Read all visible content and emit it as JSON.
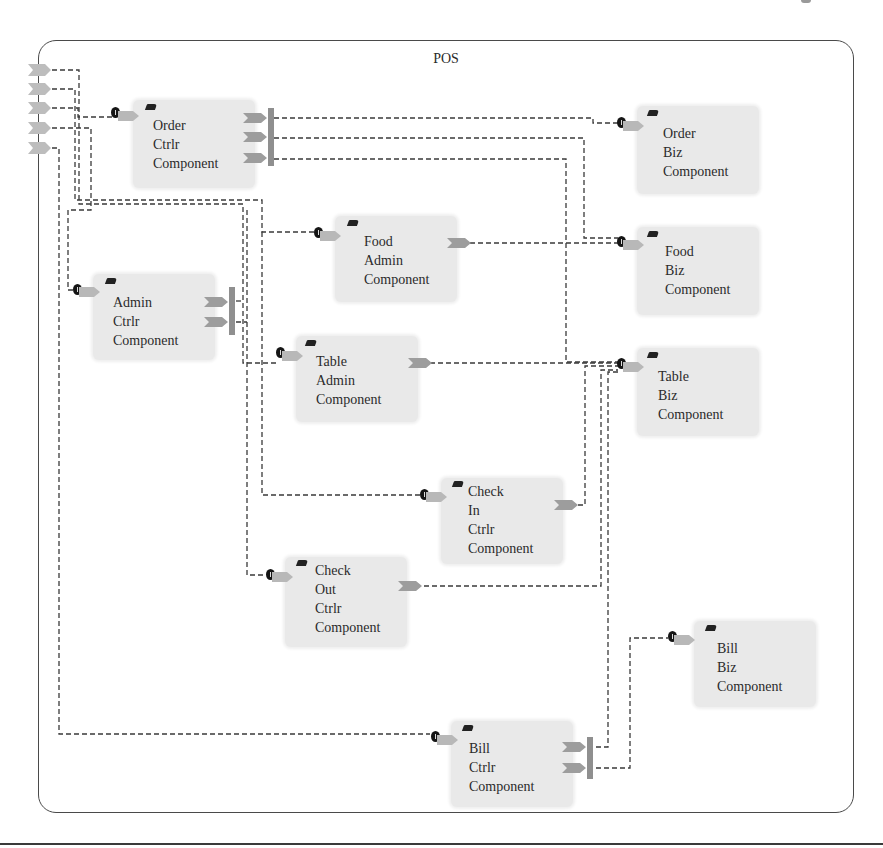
{
  "diagram": {
    "title": "POS",
    "type": "component-diagram",
    "colors": {
      "frame_border": "#4a4a4a",
      "component_fill": "#e9e9e9",
      "port_provided": "#b4b4b4",
      "port_required": "#9a9a9a",
      "wire": "#3a3a3a"
    }
  },
  "components": [
    {
      "id": "order-ctrlr",
      "label": "Order\nCtrlr\nComponent",
      "ports_out": 3
    },
    {
      "id": "food-admin",
      "label": "Food\nAdmin\nComponent",
      "ports_out": 1
    },
    {
      "id": "admin-ctrlr",
      "label": "Admin\nCtrlr\nComponent",
      "ports_out": 2
    },
    {
      "id": "table-admin",
      "label": "Table\nAdmin\nComponent",
      "ports_out": 1
    },
    {
      "id": "check-in-ctrlr",
      "label": "Check\nIn\nCtrlr\nComponent",
      "ports_out": 1
    },
    {
      "id": "check-out-ctrlr",
      "label": "Check\nOut\nCtrlr\nComponent",
      "ports_out": 1
    },
    {
      "id": "bill-ctrlr",
      "label": "Bill\nCtrlr\nComponent",
      "ports_out": 2
    },
    {
      "id": "order-biz",
      "label": "Order\nBiz\nComponent",
      "ports_out": 0
    },
    {
      "id": "food-biz",
      "label": "Food\nBiz\nComponent",
      "ports_out": 0
    },
    {
      "id": "table-biz",
      "label": "Table\nBiz\nComponent",
      "ports_out": 0
    },
    {
      "id": "bill-biz",
      "label": "Bill\nBiz\nComponent",
      "ports_out": 0
    }
  ],
  "external_ports": 5,
  "connections": [
    {
      "from": "external-port-1",
      "to": "order-ctrlr"
    },
    {
      "from": "external-port-2",
      "to": "food-admin"
    },
    {
      "from": "external-port-3",
      "to": "admin-ctrlr"
    },
    {
      "from": "external-port-4",
      "to": "check-in-ctrlr"
    },
    {
      "from": "external-port-5",
      "to": "bill-ctrlr"
    },
    {
      "from": "order-ctrlr",
      "to": "order-biz"
    },
    {
      "from": "order-ctrlr",
      "to": "food-biz"
    },
    {
      "from": "order-ctrlr",
      "to": "table-biz"
    },
    {
      "from": "food-admin",
      "to": "food-biz"
    },
    {
      "from": "admin-ctrlr",
      "to": "table-admin"
    },
    {
      "from": "admin-ctrlr",
      "to": "check-out-ctrlr"
    },
    {
      "from": "table-admin",
      "to": "table-biz"
    },
    {
      "from": "check-in-ctrlr",
      "to": "table-biz"
    },
    {
      "from": "check-out-ctrlr",
      "to": "table-biz"
    },
    {
      "from": "bill-ctrlr",
      "to": "table-biz"
    },
    {
      "from": "bill-ctrlr",
      "to": "bill-biz"
    }
  ]
}
